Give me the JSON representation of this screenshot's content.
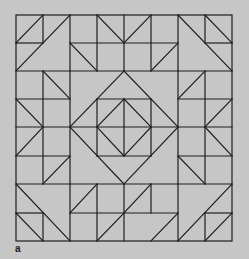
{
  "figure": {
    "caption_label": "a",
    "background_color": "#c6c6c6",
    "line_color": "#1e1e1e",
    "grid": {
      "columns": 8,
      "rows": 8,
      "column_px": [
        16,
        43,
        70,
        97,
        124,
        151,
        178,
        205,
        232
      ],
      "row_px": [
        15,
        43,
        71,
        99,
        127,
        156,
        184,
        213,
        241
      ]
    },
    "border": [
      [
        0,
        0
      ],
      [
        8,
        8
      ]
    ],
    "segments": [
      [
        [
          0,
          1
        ],
        [
          1,
          0
        ]
      ],
      [
        [
          1,
          0
        ],
        [
          1,
          1
        ]
      ],
      [
        [
          0,
          1
        ],
        [
          1,
          1
        ]
      ],
      [
        [
          0,
          2
        ],
        [
          2,
          0
        ]
      ],
      [
        [
          0,
          2
        ],
        [
          2,
          2
        ]
      ],
      [
        [
          2,
          0
        ],
        [
          2,
          8
        ]
      ],
      [
        [
          3,
          0
        ],
        [
          3,
          2
        ]
      ],
      [
        [
          4,
          0
        ],
        [
          4,
          2
        ]
      ],
      [
        [
          5,
          0
        ],
        [
          5,
          2
        ]
      ],
      [
        [
          2,
          1
        ],
        [
          6,
          1
        ]
      ],
      [
        [
          2,
          2
        ],
        [
          6,
          2
        ]
      ],
      [
        [
          3,
          0
        ],
        [
          4,
          1
        ]
      ],
      [
        [
          4,
          1
        ],
        [
          5,
          0
        ]
      ],
      [
        [
          2,
          1
        ],
        [
          3,
          2
        ]
      ],
      [
        [
          5,
          2
        ],
        [
          6,
          1
        ]
      ],
      [
        [
          6,
          0
        ],
        [
          6,
          8
        ]
      ],
      [
        [
          6,
          0
        ],
        [
          8,
          2
        ]
      ],
      [
        [
          7,
          0
        ],
        [
          7,
          1
        ]
      ],
      [
        [
          7,
          0
        ],
        [
          8,
          1
        ]
      ],
      [
        [
          7,
          1
        ],
        [
          8,
          1
        ]
      ],
      [
        [
          6,
          2
        ],
        [
          8,
          2
        ]
      ],
      [
        [
          1,
          2
        ],
        [
          1,
          6
        ]
      ],
      [
        [
          1,
          2
        ],
        [
          2,
          3
        ]
      ],
      [
        [
          0,
          3
        ],
        [
          2,
          3
        ]
      ],
      [
        [
          0,
          3
        ],
        [
          1,
          4
        ]
      ],
      [
        [
          0,
          4
        ],
        [
          2,
          4
        ]
      ],
      [
        [
          0,
          5
        ],
        [
          1,
          4
        ]
      ],
      [
        [
          0,
          5
        ],
        [
          2,
          5
        ]
      ],
      [
        [
          1,
          6
        ],
        [
          2,
          5
        ]
      ],
      [
        [
          0,
          6
        ],
        [
          2,
          6
        ]
      ],
      [
        [
          7,
          2
        ],
        [
          7,
          6
        ]
      ],
      [
        [
          6,
          3
        ],
        [
          7,
          2
        ]
      ],
      [
        [
          6,
          3
        ],
        [
          8,
          3
        ]
      ],
      [
        [
          7,
          4
        ],
        [
          8,
          3
        ]
      ],
      [
        [
          6,
          4
        ],
        [
          8,
          4
        ]
      ],
      [
        [
          7,
          4
        ],
        [
          8,
          5
        ]
      ],
      [
        [
          6,
          5
        ],
        [
          8,
          5
        ]
      ],
      [
        [
          6,
          5
        ],
        [
          7,
          6
        ]
      ],
      [
        [
          6,
          6
        ],
        [
          8,
          6
        ]
      ],
      [
        [
          4,
          2
        ],
        [
          6,
          4
        ]
      ],
      [
        [
          6,
          4
        ],
        [
          4,
          6
        ]
      ],
      [
        [
          4,
          6
        ],
        [
          2,
          4
        ]
      ],
      [
        [
          2,
          4
        ],
        [
          4,
          2
        ]
      ],
      [
        [
          3,
          3
        ],
        [
          5,
          3
        ]
      ],
      [
        [
          5,
          3
        ],
        [
          5,
          5
        ]
      ],
      [
        [
          5,
          5
        ],
        [
          3,
          5
        ]
      ],
      [
        [
          3,
          5
        ],
        [
          3,
          3
        ]
      ],
      [
        [
          4,
          3
        ],
        [
          5,
          4
        ]
      ],
      [
        [
          5,
          4
        ],
        [
          4,
          5
        ]
      ],
      [
        [
          4,
          5
        ],
        [
          3,
          4
        ]
      ],
      [
        [
          3,
          4
        ],
        [
          4,
          3
        ]
      ],
      [
        [
          2,
          4
        ],
        [
          6,
          4
        ]
      ],
      [
        [
          4,
          3
        ],
        [
          4,
          5
        ]
      ],
      [
        [
          0,
          6
        ],
        [
          2,
          8
        ]
      ],
      [
        [
          0,
          7
        ],
        [
          1,
          7
        ]
      ],
      [
        [
          1,
          7
        ],
        [
          1,
          8
        ]
      ],
      [
        [
          0,
          7
        ],
        [
          1,
          8
        ]
      ],
      [
        [
          2,
          6
        ],
        [
          6,
          6
        ]
      ],
      [
        [
          2,
          7
        ],
        [
          6,
          7
        ]
      ],
      [
        [
          3,
          6
        ],
        [
          3,
          8
        ]
      ],
      [
        [
          4,
          6
        ],
        [
          4,
          8
        ]
      ],
      [
        [
          5,
          6
        ],
        [
          5,
          7
        ]
      ],
      [
        [
          2,
          7
        ],
        [
          3,
          6
        ]
      ],
      [
        [
          4,
          7
        ],
        [
          5,
          6
        ]
      ],
      [
        [
          3,
          8
        ],
        [
          4,
          7
        ]
      ],
      [
        [
          5,
          8
        ],
        [
          6,
          7
        ]
      ],
      [
        [
          6,
          8
        ],
        [
          8,
          6
        ]
      ],
      [
        [
          7,
          7
        ],
        [
          8,
          7
        ]
      ],
      [
        [
          7,
          7
        ],
        [
          7,
          8
        ]
      ],
      [
        [
          7,
          8
        ],
        [
          8,
          7
        ]
      ]
    ]
  }
}
